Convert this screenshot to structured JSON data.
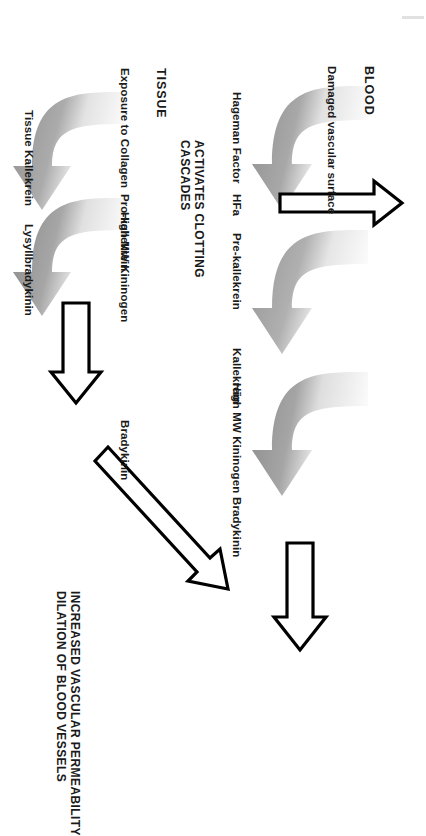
{
  "diagram": {
    "sections": {
      "blood_header": "BLOOD",
      "tissue_header": "TISSUE"
    },
    "blood_pathway": {
      "trigger": "Damaged vascular surface",
      "substrate_1": "Hageman Factor",
      "product_1": "HFa",
      "cofactor_2": "Pre-kallekrein",
      "product_2": "Kallekrein",
      "cofactor_3": "High MW Kininogen",
      "product_3": "Bradykinin",
      "clotting_note": "ACTIVATES CLOTTING\nCASCADES"
    },
    "tissue_pathway": {
      "trigger": "Exposure to Collagen",
      "cofactor_1": "Pro-kallekrein",
      "product_1": "Tissue Kallekrein",
      "cofactor_2": "High MW Kininogen",
      "product_2": "Lysyllbradykinin",
      "product_3": "Bradykinin"
    },
    "outcome": "INCREASED VASCULAR PERMEABILITY\nDILATION OF BLOOD VESSELS",
    "colors": {
      "text": "#1a1a1a",
      "arrow_outline": "#000000",
      "arrow_fill": "#ffffff",
      "curve_dark": "#9a9a9a",
      "curve_light": "#efefef"
    }
  }
}
